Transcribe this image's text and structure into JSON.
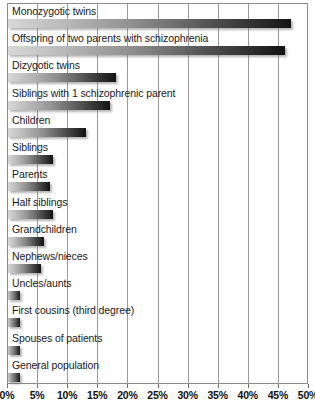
{
  "chart_data": {
    "type": "bar",
    "orientation": "horizontal",
    "title": "",
    "subtitle": "",
    "xlabel": "",
    "ylabel": "",
    "xlim": [
      0,
      50
    ],
    "xtick_step": 5,
    "grid": true,
    "legend": null,
    "value_suffix": "%",
    "categories": [
      "Monozygotic twins",
      "Offspring of two parents with schizophrenia",
      "Dizygotic twins",
      "Siblings with 1 schizophrenic parent",
      "Children",
      "Siblings",
      "Parents",
      "Half siblings",
      "Grandchildren",
      "Nephews/nieces",
      "Uncles/aunts",
      "First cousins (third degree)",
      "Spouses of patients",
      "General population"
    ],
    "values": [
      47,
      46,
      18,
      17,
      13,
      7.5,
      7,
      7.5,
      6,
      5.5,
      2,
      2,
      2,
      2
    ],
    "tick_labels": [
      "0%",
      "5%",
      "10%",
      "15%",
      "20%",
      "25%",
      "30%",
      "35%",
      "40%",
      "45%",
      "50%"
    ],
    "tick_values": [
      0,
      5,
      10,
      15,
      20,
      25,
      30,
      35,
      40,
      45,
      50
    ],
    "colors": {
      "bar_gradient_start": "#d8d8d8",
      "bar_gradient_end": "#131313",
      "gridline": "#9a9a9a",
      "frame": "#8a8a8a",
      "text": "#1a1a1a",
      "background": "#ffffff"
    }
  }
}
